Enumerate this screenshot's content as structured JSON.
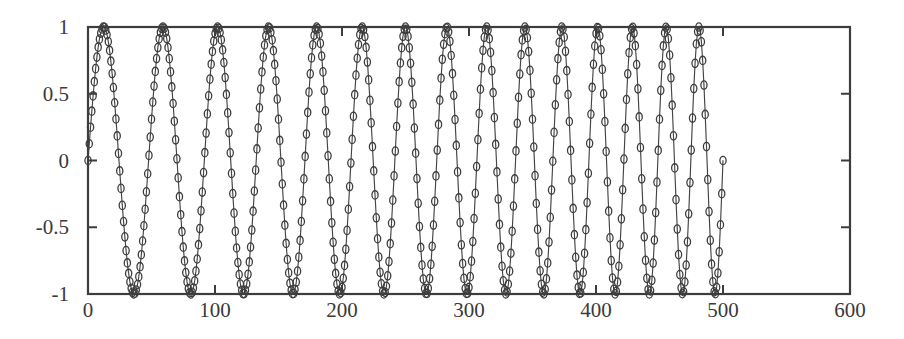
{
  "chart_data": {
    "type": "line",
    "title": "",
    "subtitle": "",
    "xlabel": "",
    "ylabel": "",
    "xlim": [
      0,
      600
    ],
    "ylim": [
      -1,
      1
    ],
    "xticks": [
      0,
      100,
      200,
      300,
      400,
      500,
      600
    ],
    "yticks": [
      -1,
      -0.5,
      0,
      0.5,
      1
    ],
    "xtick_labels": [
      "0",
      "100",
      "200",
      "300",
      "400",
      "500",
      "600"
    ],
    "ytick_labels": [
      "-1",
      "-0.5",
      "0",
      "0.5",
      "1"
    ],
    "grid": false,
    "legend": null,
    "frame": "box",
    "tick_direction": "in",
    "annotations": [],
    "line_color": "#444444",
    "marker_color": "#3d3d3d",
    "marker_style": "circle",
    "axis_color": "#3d3d3d",
    "background_color": "#ffffff",
    "series": [
      {
        "name": "chirp",
        "n_start": 0,
        "n_end": 500,
        "formula": "sin(2*pi*(f0*n + 0.5*k*n*n))",
        "f0": 0.02,
        "k": 4e-05,
        "amplitude": 1.0,
        "sample_step": 1,
        "start_period": 50,
        "end_period": 25,
        "y_first": 0,
        "y_last": 0
      }
    ],
    "extrema_markers": [
      {
        "x": 0,
        "y": 0.0
      },
      {
        "x": 13,
        "y": 0.87
      },
      {
        "x": 38,
        "y": -0.92
      },
      {
        "x": 64,
        "y": 0.88
      },
      {
        "x": 89,
        "y": -0.93
      },
      {
        "x": 114,
        "y": 0.93
      },
      {
        "x": 139,
        "y": -0.9
      },
      {
        "x": 164,
        "y": 0.79
      },
      {
        "x": 189,
        "y": -0.88
      },
      {
        "x": 213,
        "y": 0.97
      },
      {
        "x": 238,
        "y": -0.9
      },
      {
        "x": 262,
        "y": 0.88
      },
      {
        "x": 287,
        "y": -0.91
      },
      {
        "x": 311,
        "y": 0.93
      },
      {
        "x": 324,
        "y": -0.99
      },
      {
        "x": 337,
        "y": 0.94
      },
      {
        "x": 349,
        "y": -0.98
      },
      {
        "x": 361,
        "y": 0.97
      },
      {
        "x": 374,
        "y": -0.93
      },
      {
        "x": 386,
        "y": 0.94
      },
      {
        "x": 398,
        "y": -1.0
      },
      {
        "x": 410,
        "y": 0.93
      },
      {
        "x": 422,
        "y": -0.92
      },
      {
        "x": 433,
        "y": 1.0
      },
      {
        "x": 445,
        "y": -0.91
      },
      {
        "x": 457,
        "y": 0.94
      },
      {
        "x": 469,
        "y": -1.0
      },
      {
        "x": 480,
        "y": 0.93
      },
      {
        "x": 491,
        "y": -0.91
      },
      {
        "x": 500,
        "y": 0.0
      }
    ]
  },
  "axes": {
    "plot_box": {
      "left": 88,
      "top": 27,
      "right": 850,
      "bottom": 294
    },
    "x_tick_label_y": 300,
    "y_tick_label_x": 78
  }
}
